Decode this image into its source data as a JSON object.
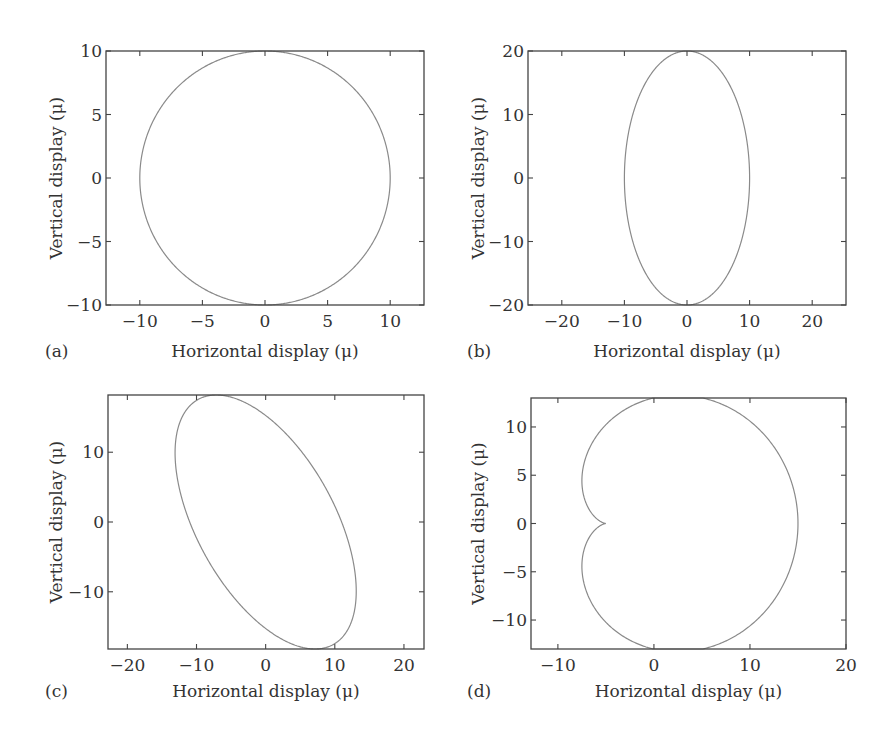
{
  "figure": {
    "panels": [
      {
        "id": "a",
        "letter": "(a)",
        "xlabel": "Horizontal display (μ)",
        "ylabel": "Vertical display (μ)"
      },
      {
        "id": "b",
        "letter": "(b)",
        "xlabel": "Horizontal display (μ)",
        "ylabel": "Vertical display (μ)"
      },
      {
        "id": "c",
        "letter": "(c)",
        "xlabel": "Horizontal display (μ)",
        "ylabel": "Vertical display (μ)"
      },
      {
        "id": "d",
        "letter": "(d)",
        "xlabel": "Horizontal display (μ)",
        "ylabel": "Vertical display (μ)"
      }
    ]
  },
  "colors": {
    "curve": "#8a8a8a",
    "frame": "#444444",
    "text": "#333333"
  },
  "chart_data": [
    {
      "panel": "(a)",
      "type": "line",
      "title": "",
      "description": "Circle (equal amplitude, 90 deg phase)",
      "xlabel": "Horizontal display (μ)",
      "ylabel": "Vertical display (μ)",
      "xlim": [
        -12.7,
        12.7
      ],
      "ylim": [
        -10,
        10
      ],
      "xticks": [
        -10,
        -5,
        0,
        5,
        10
      ],
      "yticks": [
        -10,
        -5,
        0,
        5,
        10
      ],
      "xtick_labels": [
        "−10",
        "−5",
        "0",
        "5",
        "10"
      ],
      "ytick_labels": [
        "−10",
        "−5",
        "0",
        "5",
        "10"
      ],
      "grid": false,
      "curve": {
        "kind": "ellipse",
        "x_amp": 10,
        "y_amp": 10,
        "phase_deg": 90
      },
      "extremes": {
        "x": [
          -10,
          10
        ],
        "y": [
          -10,
          10
        ]
      }
    },
    {
      "panel": "(b)",
      "type": "line",
      "title": "",
      "description": "Vertical ellipse",
      "xlabel": "Horizontal display (μ)",
      "ylabel": "Vertical display (μ)",
      "xlim": [
        -25.4,
        25.4
      ],
      "ylim": [
        -20,
        20
      ],
      "xticks": [
        -20,
        -10,
        0,
        10,
        20
      ],
      "yticks": [
        -20,
        -10,
        0,
        10,
        20
      ],
      "xtick_labels": [
        "−20",
        "−10",
        "0",
        "10",
        "20"
      ],
      "ytick_labels": [
        "−20",
        "−10",
        "0",
        "10",
        "20"
      ],
      "grid": false,
      "curve": {
        "kind": "ellipse",
        "x_amp": 10,
        "y_amp": 20,
        "phase_deg": 90
      },
      "extremes": {
        "x": [
          -10,
          10
        ],
        "y": [
          -20,
          20
        ]
      }
    },
    {
      "panel": "(c)",
      "type": "line",
      "title": "",
      "description": "Tilted ellipse",
      "xlabel": "Horizontal display (μ)",
      "ylabel": "Vertical display (μ)",
      "xlim": [
        -22.8,
        22.9
      ],
      "ylim": [
        -18.2,
        18.2
      ],
      "xticks": [
        -20,
        -10,
        0,
        10,
        20
      ],
      "yticks": [
        -10,
        0,
        10
      ],
      "xtick_labels": [
        "−20",
        "−10",
        "0",
        "10",
        "20"
      ],
      "ytick_labels": [
        "−10",
        "0",
        "10"
      ],
      "grid": false,
      "curve": {
        "kind": "ellipse",
        "x_amp": 13.1,
        "y_amp": 18.2,
        "phase_deg": 123
      },
      "extremes": {
        "x": [
          -13.1,
          13.1
        ],
        "y": [
          -18.2,
          18.2
        ]
      }
    },
    {
      "panel": "(d)",
      "type": "line",
      "title": "",
      "description": "Cardioid-like (limacon) orbit with cusp at x=-5",
      "xlabel": "Horizontal display (μ)",
      "ylabel": "Vertical display (μ)",
      "xlim": [
        -12.8,
        20
      ],
      "ylim": [
        -13,
        13
      ],
      "xticks": [
        -10,
        0,
        10,
        20
      ],
      "yticks": [
        -10,
        -5,
        0,
        5,
        10
      ],
      "xtick_labels": [
        "−10",
        "0",
        "10",
        "20"
      ],
      "ytick_labels": [
        "−10",
        "−5",
        "0",
        "5",
        "10"
      ],
      "grid": false,
      "curve": {
        "kind": "epicycle",
        "a1": 10,
        "a2": 5
      },
      "extremes": {
        "x": [
          -7.4,
          15
        ],
        "y": [
          -13,
          13
        ],
        "cusp": [
          -5,
          0
        ]
      }
    }
  ],
  "layout": {
    "boxes": [
      {
        "left": 106,
        "top": 51,
        "right": 424,
        "bottom": 305
      },
      {
        "left": 528,
        "top": 51,
        "right": 846,
        "bottom": 305
      },
      {
        "left": 108,
        "top": 395,
        "right": 424,
        "bottom": 649
      },
      {
        "left": 531,
        "top": 398,
        "right": 846,
        "bottom": 649
      }
    ],
    "letter_x": [
      45,
      467,
      45,
      467
    ],
    "xlabel_y": [
      357,
      357,
      697,
      697
    ],
    "ylabel_x": [
      62,
      484,
      62,
      484
    ]
  }
}
